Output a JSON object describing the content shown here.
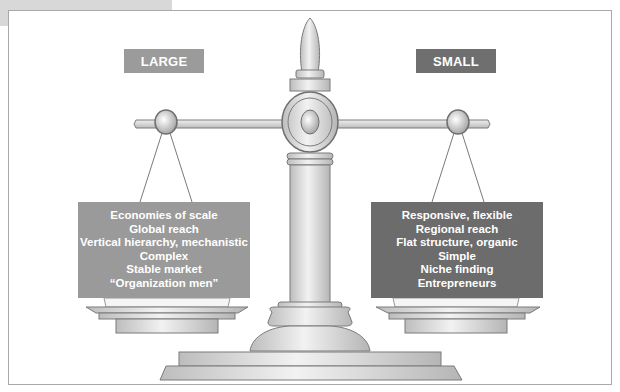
{
  "diagram": {
    "type": "balance-scale-comparison",
    "colors": {
      "large_label_bg": "#9b9b9b",
      "small_label_bg": "#6f6f6f",
      "large_box_bg": "#9a9a9a",
      "small_box_bg": "#6c6c6c",
      "scale_fill": "#d9d9d9",
      "scale_stroke": "#7a7a7a"
    },
    "left": {
      "label": "LARGE",
      "items": [
        "Economies of scale",
        "Global reach",
        "Vertical hierarchy, mechanistic",
        "Complex",
        "Stable market",
        "“Organization men”"
      ]
    },
    "right": {
      "label": "SMALL",
      "items": [
        "Responsive, flexible",
        "Regional reach",
        "Flat structure, organic",
        "Simple",
        "Niche finding",
        "Entrepreneurs"
      ]
    }
  }
}
